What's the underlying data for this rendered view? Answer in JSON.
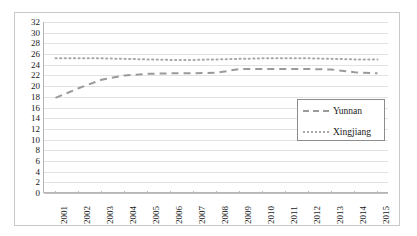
{
  "chart_data": {
    "type": "line",
    "title": "",
    "subtitle": "",
    "xlabel": "",
    "ylabel": "",
    "categories": [
      "2001",
      "2002",
      "2003",
      "2004",
      "2005",
      "2006",
      "2007",
      "2008",
      "2009",
      "2010",
      "2011",
      "2012",
      "2013",
      "2014",
      "2015"
    ],
    "ylim": [
      0,
      32
    ],
    "y_ticks": [
      0,
      2,
      4,
      6,
      8,
      10,
      12,
      14,
      16,
      18,
      20,
      22,
      24,
      26,
      28,
      30,
      32
    ],
    "grid": "horizontal",
    "legend_position": "center-right",
    "series": [
      {
        "name": "Yunnan",
        "style": "dashed",
        "color": "#9a9a9a",
        "values": [
          17.8,
          19.6,
          21.2,
          22.0,
          22.3,
          22.4,
          22.4,
          22.5,
          23.2,
          23.2,
          23.2,
          23.2,
          23.1,
          22.6,
          22.4
        ]
      },
      {
        "name": "Xingjiang",
        "style": "dotted",
        "color": "#a8a8a8",
        "values": [
          25.2,
          25.2,
          25.2,
          25.1,
          25.0,
          24.9,
          24.9,
          25.0,
          25.1,
          25.2,
          25.2,
          25.2,
          25.1,
          25.0,
          25.0
        ]
      }
    ]
  },
  "legend": {
    "items": [
      {
        "label": "Yunnan",
        "style": "dashed"
      },
      {
        "label": "Xingjiang",
        "style": "dotted"
      }
    ]
  },
  "axes": {
    "y_tick_labels": [
      "32",
      "30",
      "28",
      "26",
      "24",
      "22",
      "20",
      "18",
      "16",
      "14",
      "12",
      "10",
      "8",
      "6",
      "4",
      "2",
      "0"
    ],
    "x_tick_labels": [
      "2001",
      "2002",
      "2003",
      "2004",
      "2005",
      "2006",
      "2007",
      "2008",
      "2009",
      "2010",
      "2011",
      "2012",
      "2013",
      "2014",
      "2015"
    ]
  }
}
